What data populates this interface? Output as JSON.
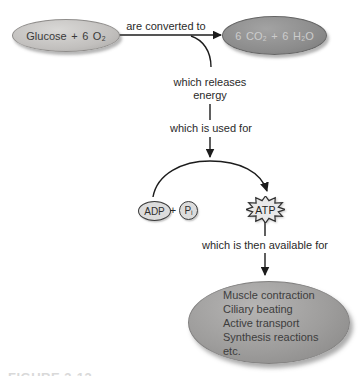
{
  "figure": {
    "reactants": "Glucose + 6 O₂",
    "products": "6 CO₂ + 6 H₂O",
    "labels": {
      "converted": "are converted to",
      "releases": "which releases\nenergy",
      "used": "which is used for",
      "available": "which is then available for"
    },
    "molecules": {
      "adp": "ADP",
      "plus": "+",
      "pi": "Pᵢ",
      "atp": "ATP"
    },
    "uses": [
      "Muscle contraction",
      "Ciliary beating",
      "Active transport",
      "Synthesis reactions",
      "etc."
    ],
    "caption_cropped": "FIGURE 3-13",
    "colors": {
      "background": "#ffffff",
      "reactant_fill": "#c6c4c2",
      "product_fill": "#8c8c8c",
      "product_text": "#cccccc",
      "uses_fill": "#9e9d9c",
      "molecule_fill": "#dcdcdc",
      "atp_fill": "#e9e9e9",
      "line": "#1c1c1c"
    }
  }
}
